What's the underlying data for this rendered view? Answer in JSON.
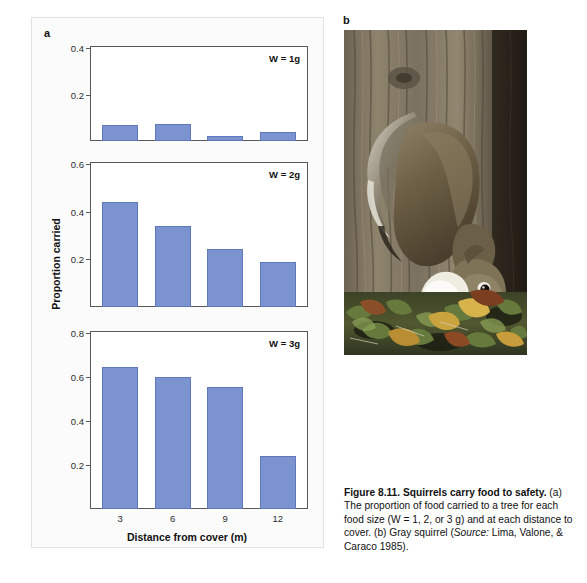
{
  "figure": {
    "panel_a_letter": "a",
    "panel_b_letter": "b",
    "caption_title": "Figure 8.11.  Squirrels carry food to safety.",
    "caption_body": "(a) The proportion of food carried to a tree for each food size (W = 1, 2, or 3 g) and at each distance to cover. (b) Gray squirrel (",
    "caption_source_label": "Source:",
    "caption_source_value": " Lima, Valone, & Caraco 1985).",
    "photo_alt": "gray-squirrel-on-tree-trunk"
  },
  "colors": {
    "bar_fill": "#7b93cf",
    "bar_stroke": "#5f78bb",
    "axis": "#575757",
    "panel_background": "#fbfbfc",
    "plot_background": "#ffffff"
  },
  "chart_data": {
    "type": "bar",
    "title": "",
    "xlabel": "Distance from cover (m)",
    "ylabel": "Proportion carried",
    "categories": [
      "3",
      "6",
      "9",
      "12"
    ],
    "grid": false,
    "legend": "none",
    "panels": [
      {
        "id": "w1",
        "annotation": "W = 1g",
        "ylim": [
          0,
          0.4
        ],
        "yticks": [
          0.2,
          0.4
        ],
        "ytick_labels": [
          "0.2",
          "0.4"
        ],
        "values": [
          0.07,
          0.075,
          0.02,
          0.04
        ]
      },
      {
        "id": "w2",
        "annotation": "W = 2g",
        "ylim": [
          0,
          0.6
        ],
        "yticks": [
          0.2,
          0.4,
          0.6
        ],
        "ytick_labels": [
          "0.2",
          "0.4",
          "0.6"
        ],
        "values": [
          0.44,
          0.34,
          0.245,
          0.19
        ]
      },
      {
        "id": "w3",
        "annotation": "W = 3g",
        "ylim": [
          0,
          0.8
        ],
        "yticks": [
          0.2,
          0.4,
          0.6,
          0.8
        ],
        "ytick_labels": [
          "0.2",
          "0.4",
          "0.6",
          "0.8"
        ],
        "values": [
          0.645,
          0.6,
          0.555,
          0.24
        ]
      }
    ]
  }
}
